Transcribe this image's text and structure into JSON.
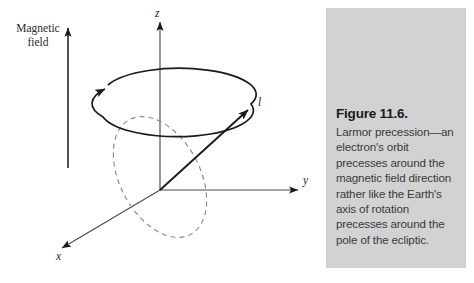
{
  "figure": {
    "type": "physics-vector-diagram",
    "background_color": "#ffffff",
    "stroke_color": "#1a1a1a",
    "labels": {
      "magnetic_field": "Magnetic\nfield",
      "axis_z": "z",
      "axis_y": "y",
      "axis_x": "x",
      "angular_momentum": "l"
    }
  },
  "caption": {
    "panel_color": "#d2d2d2",
    "title": "Figure 11.6.",
    "body": "Larmor precession—an electron's orbit precesses around the magnetic field direction rather like the Earth's axis of rotation precesses around the pole of the ecliptic."
  },
  "diagram_data": {
    "type": "diagram",
    "elements": [
      {
        "name": "magnetic-field-arrow",
        "direction": "up",
        "style": "solid"
      },
      {
        "name": "z-axis",
        "direction": "up",
        "style": "solid-arrow"
      },
      {
        "name": "y-axis",
        "direction": "right",
        "style": "solid-arrow"
      },
      {
        "name": "x-axis",
        "direction": "down-left",
        "style": "solid-arrow"
      },
      {
        "name": "precession-cone-ellipse",
        "style": "solid",
        "arrow": "counterclockwise-left"
      },
      {
        "name": "angular-momentum-vector",
        "style": "solid-arrow",
        "from": "origin",
        "to": "upper-right"
      },
      {
        "name": "electron-orbit-ellipse",
        "style": "dashed"
      }
    ]
  }
}
